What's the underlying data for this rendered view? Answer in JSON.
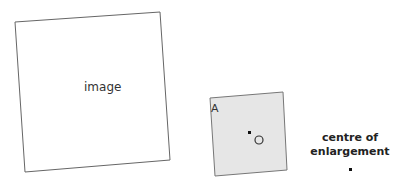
{
  "diagram": {
    "image_shape": {
      "label": "image",
      "corners": [
        [
          15,
          22
        ],
        [
          160,
          12
        ],
        [
          170,
          160
        ],
        [
          25,
          172
        ]
      ],
      "fill": "#ffffff",
      "stroke": "#666666"
    },
    "object_shape": {
      "vertex_label": "A",
      "centre_marker_label": "O",
      "corners": [
        [
          210,
          98
        ],
        [
          283,
          92
        ],
        [
          287,
          170
        ],
        [
          215,
          176
        ]
      ],
      "fill": "#e6e6e6",
      "stroke": "#777777"
    },
    "centre_of_enlargement": {
      "label_line1": "centre of",
      "label_line2": "enlargement"
    }
  }
}
